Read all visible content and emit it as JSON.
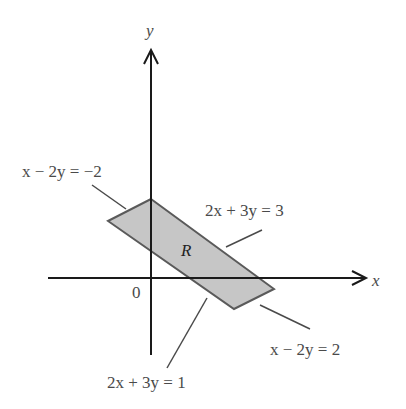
{
  "figure": {
    "type": "coordinate-plane-region",
    "axes": {
      "x_label": "x",
      "y_label": "y",
      "origin_label": "0"
    },
    "region": {
      "label": "R",
      "fill_color": "#c8c8c8",
      "stroke_color": "#555555"
    },
    "boundary_lines": [
      {
        "id": "top-left",
        "equation": "x − 2y = −2"
      },
      {
        "id": "top-right",
        "equation": "2x + 3y = 3"
      },
      {
        "id": "bottom-right",
        "equation": "x − 2y = 2"
      },
      {
        "id": "bottom-left",
        "equation": "2x + 3y = 1"
      }
    ]
  },
  "labels": {
    "eq1": "x − 2y = −2",
    "eq2": "2x + 3y = 3",
    "eq3": "x − 2y = 2",
    "eq4": "2x + 3y = 1",
    "region": "R",
    "x_axis": "x",
    "y_axis": "y",
    "origin": "0"
  }
}
